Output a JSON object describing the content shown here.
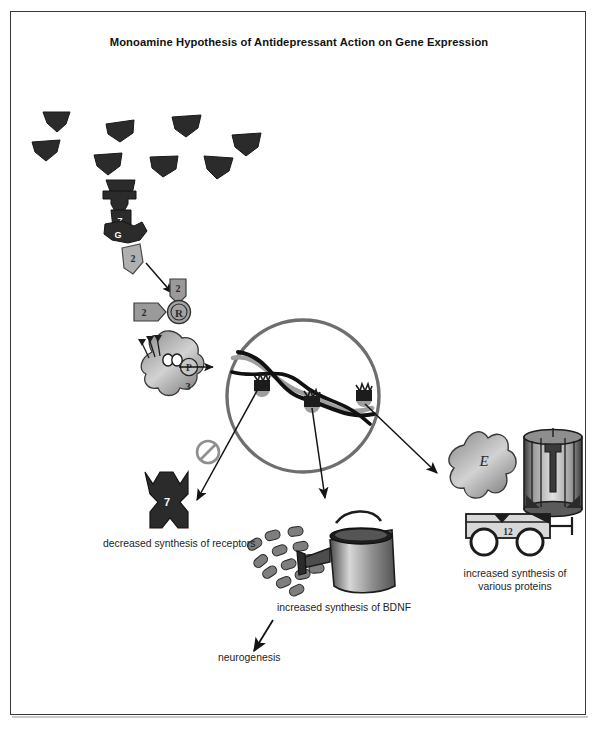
{
  "figure": {
    "title": "Monoamine Hypothesis of Antidepressant Action on Gene Expression",
    "border_color": "#3a3a3a",
    "background": "#ffffff"
  },
  "colors": {
    "neurotransmitter": "#2b2b2b",
    "receptor": "#2b2b2b",
    "enzyme_gray": "#9a9a9a",
    "nucleus_ring": "#6e6e6e",
    "dna_strand": "#111111",
    "arrow": "#1a1a1a",
    "text": "#1e1e1e",
    "inhibition": "#8a8a8a"
  },
  "elements": {
    "neurotransmitters": {
      "name": "monoamine neurotransmitter cluster",
      "count": 9
    },
    "receptor_top": {
      "label": "7",
      "name": "seven-transmembrane receptor"
    },
    "g_protein": {
      "label": "G",
      "name": "g-protein"
    },
    "second_messenger": {
      "label": "2",
      "name": "second messenger"
    },
    "enzyme_a": {
      "label": "2",
      "name": "second messenger enzyme"
    },
    "enzyme_b": {
      "label": "2",
      "name": "second messenger enzyme"
    },
    "kinase_r": {
      "label": "R",
      "name": "protein kinase regulatory unit"
    },
    "transcription_factor": {
      "label": "3",
      "name": "transcription factor"
    },
    "phosphate": {
      "label": "P",
      "name": "phosphate group"
    },
    "nucleus": {
      "name": "cell nucleus"
    },
    "dna": {
      "name": "dna double helix",
      "gene_marker_count": 3
    },
    "inhibition_symbol": {
      "name": "inhibition symbol"
    },
    "receptor_down": {
      "label": "7",
      "name": "downregulated receptor"
    },
    "bdnf_vesicles": {
      "name": "bdnf protein particles",
      "count": 13
    },
    "watering_can": {
      "name": "watering can"
    },
    "protein_enzyme": {
      "label": "E",
      "name": "enzyme protein"
    },
    "ion_channel": {
      "name": "ion channel protein"
    },
    "transporter": {
      "label": "12",
      "name": "twelve-transmembrane transporter"
    }
  },
  "annotations": {
    "decreased_receptors": "decreased synthesis of receptors",
    "increased_bdnf": "increased synthesis of BDNF",
    "increased_proteins": "increased synthesis of\nvarious proteins",
    "neurogenesis": "neurogenesis"
  }
}
